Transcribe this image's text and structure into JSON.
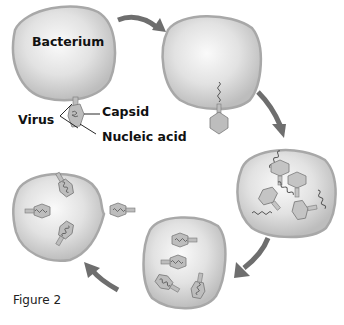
{
  "diagram": {
    "type": "viral-lytic-cycle",
    "caption": "Figure 2",
    "labels": {
      "bacterium": "Bacterium",
      "virus": "Virus",
      "capsid": "Capsid",
      "nucleic_acid": "Nucleic acid"
    },
    "stages": [
      {
        "id": 1,
        "description": "Virus attaches to bacterium"
      },
      {
        "id": 2,
        "description": "Viral nucleic acid injected into bacterium"
      },
      {
        "id": 3,
        "description": "New viral capsids and nucleic acid produced"
      },
      {
        "id": 4,
        "description": "New viruses assembled"
      },
      {
        "id": 5,
        "description": "New viruses released from bacterium"
      }
    ],
    "colors": {
      "cell_fill": "#d9d9d9",
      "cell_outline": "#a8a8a8",
      "arrow": "#6e6e6e",
      "virus_fill": "#b9b9b9"
    }
  }
}
